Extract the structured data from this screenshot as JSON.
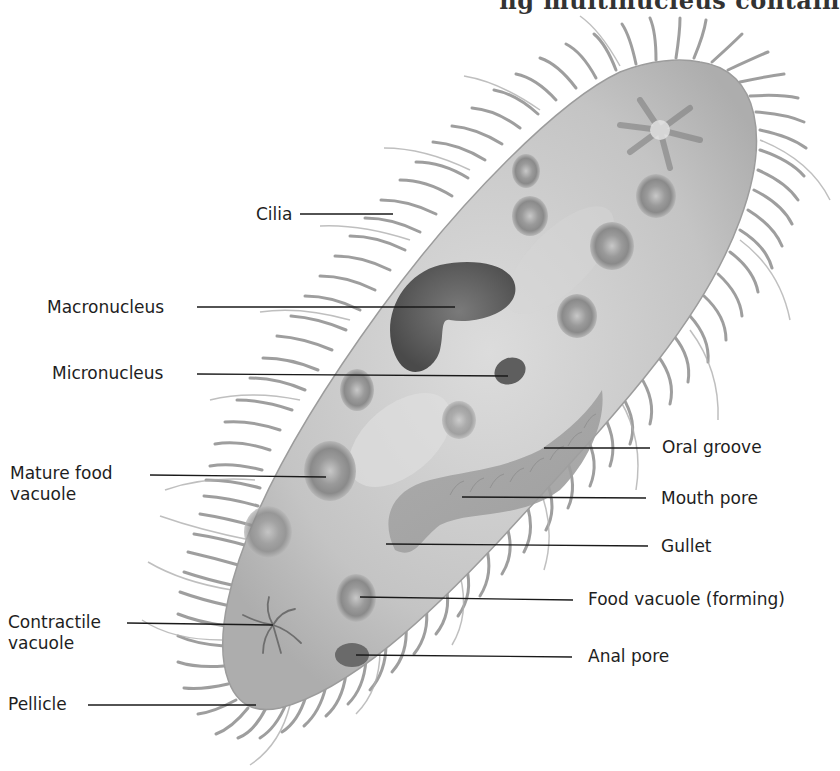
{
  "header": {
    "clipped_text": "ng multinucleus contain"
  },
  "figure": {
    "labels_left": [
      {
        "id": "cilia",
        "text": "Cilia"
      },
      {
        "id": "macronucleus",
        "text": "Macronucleus"
      },
      {
        "id": "micronucleus",
        "text": "Micronucleus"
      },
      {
        "id": "mature-food-vacuole",
        "text_line1": "Mature food",
        "text_line2": "vacuole"
      },
      {
        "id": "contractile-vacuole",
        "text_line1": "Contractile",
        "text_line2": "vacuole"
      },
      {
        "id": "pellicle",
        "text": "Pellicle"
      }
    ],
    "labels_right": [
      {
        "id": "oral-groove",
        "text": "Oral groove"
      },
      {
        "id": "mouth-pore",
        "text": "Mouth pore"
      },
      {
        "id": "gullet",
        "text": "Gullet"
      },
      {
        "id": "food-vacuole-forming",
        "text": "Food vacuole (forming)"
      },
      {
        "id": "anal-pore",
        "text": "Anal pore"
      }
    ],
    "colors": {
      "body": "#c8c8c8",
      "cilia": "#8a8a8a",
      "nucleus": "#5a5a5a",
      "vacuole": "#8c8c8c",
      "leader": "#1a1a1a",
      "text": "#1e1e1e"
    }
  }
}
